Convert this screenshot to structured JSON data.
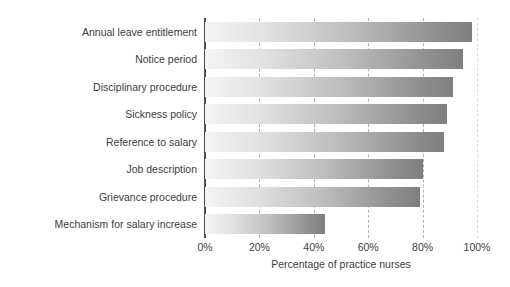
{
  "chart_data": {
    "type": "bar",
    "orientation": "horizontal",
    "title": "",
    "xlabel": "Percentage of practice nurses",
    "ylabel": "",
    "categories": [
      "Annual leave entitlement",
      "Notice period",
      "Disciplinary procedure",
      "Sickness policy",
      "Reference to salary",
      "Job description",
      "Grievance procedure",
      "Mechanism for salary increase"
    ],
    "values": [
      98,
      95,
      91,
      89,
      88,
      80,
      79,
      44
    ],
    "xlim": [
      0,
      100
    ],
    "xticks": [
      0,
      20,
      40,
      60,
      80,
      100
    ],
    "xtick_labels": [
      "0%",
      "20%",
      "40%",
      "60%",
      "80%",
      "100%"
    ],
    "grid": true,
    "grid_axis": "x",
    "grid_style": "dashed",
    "legend": false,
    "bar_gradient_start": "#f4f4f4",
    "bar_gradient_end": "#7f7f7f",
    "axis_color": "#4d4d4d",
    "grid_color": "#b3b3b3",
    "text_color": "#3d3d3d",
    "background": "#ffffff"
  }
}
